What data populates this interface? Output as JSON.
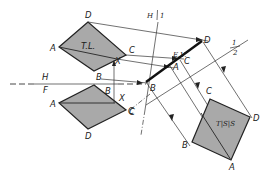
{
  "figure": {
    "type": "descriptive-geometry-auxiliary-views",
    "colors": {
      "face": "#a9a9a9",
      "line": "#222222",
      "background": "#ffffff"
    }
  },
  "fold_lines": {
    "hf": {
      "upper_label": "H",
      "lower_label": "F"
    },
    "h1": {
      "label_h": "H",
      "label_1": "1"
    },
    "one_two": {
      "label_1": "1",
      "label_2": "2"
    }
  },
  "top_view": {
    "vertices": {
      "a": "A",
      "b": "B",
      "c": "C",
      "d": "D",
      "x": "X"
    },
    "annotation": "T.L."
  },
  "front_view": {
    "vertices": {
      "a": "A",
      "b": "B",
      "c": "C",
      "d": "D",
      "x": "X"
    }
  },
  "auxiliary_view_1": {
    "vertices": {
      "a": "A",
      "b": "B",
      "c": "C",
      "d": "D"
    },
    "annotation": "E.V."
  },
  "auxiliary_view_2": {
    "vertices": {
      "a": "A",
      "b": "B",
      "c": "C",
      "d": "D"
    },
    "annotation": "T|S|S"
  },
  "misc_labels": {
    "c_left": "C"
  }
}
